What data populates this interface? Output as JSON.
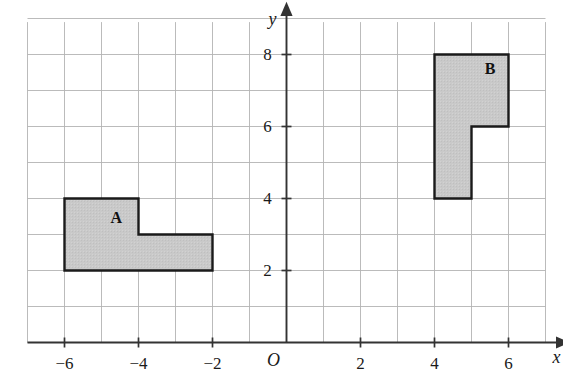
{
  "chart_data": {
    "type": "scatter",
    "title": "",
    "xlabel": "x",
    "ylabel": "y",
    "origin_label": "O",
    "grid": true,
    "xlim": [
      -7,
      7
    ],
    "ylim": [
      -1,
      9
    ],
    "x_ticks": [
      -6,
      -4,
      -2,
      2,
      4,
      6
    ],
    "x_tick_labels": [
      "−6",
      "−4",
      "−2",
      "2",
      "4",
      "6"
    ],
    "y_ticks": [
      2,
      4,
      6,
      8
    ],
    "y_tick_labels": [
      "2",
      "4",
      "6",
      "8"
    ],
    "grid_spacing": 1,
    "shapes": [
      {
        "label": "A",
        "label_point": [
          -4.6,
          3.45
        ],
        "fill": "#c9c9c9",
        "stroke": "#1a1a1a",
        "vertices": [
          [
            -6,
            4
          ],
          [
            -4,
            4
          ],
          [
            -4,
            3
          ],
          [
            -2,
            3
          ],
          [
            -2,
            2
          ],
          [
            -6,
            2
          ]
        ]
      },
      {
        "label": "B",
        "label_point": [
          5.5,
          7.6
        ],
        "fill": "#c9c9c9",
        "stroke": "#1a1a1a",
        "vertices": [
          [
            4,
            8
          ],
          [
            6,
            8
          ],
          [
            6,
            6
          ],
          [
            5,
            6
          ],
          [
            5,
            4
          ],
          [
            4,
            4
          ]
        ]
      }
    ],
    "colors": {
      "grid": "#b3b3b3",
      "axis": "#333333",
      "shape_fill": "#c9c9c9",
      "shape_stroke": "#1a1a1a",
      "background": "#ffffff"
    }
  }
}
